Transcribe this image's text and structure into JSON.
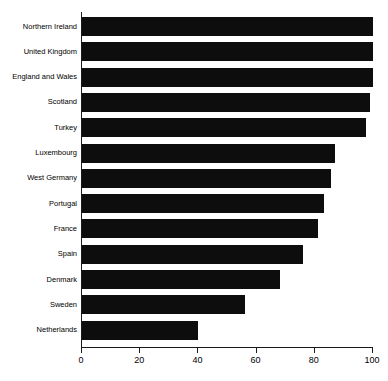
{
  "chart_data": {
    "type": "bar",
    "orientation": "horizontal",
    "title": "",
    "subtitle": "",
    "xlabel": "",
    "ylabel": "",
    "xlim": [
      0,
      100
    ],
    "xticks": [
      0,
      20,
      40,
      60,
      80,
      100
    ],
    "xtick_labels": [
      "0",
      "20",
      "40",
      "60",
      "80",
      "100"
    ],
    "grid": false,
    "legend": false,
    "bar_color": "#0d0d0d",
    "axis_color": "#1a1a1a",
    "categories": [
      "Northern Ireland",
      "United Kingdom",
      "England and Wales",
      "Scotland",
      "Turkey",
      "Luxembourg",
      "West Germany",
      "Portugal",
      "France",
      "Spain",
      "Denmark",
      "Sweden",
      "Netherlands"
    ],
    "values": [
      100,
      100,
      100,
      99,
      97.5,
      87,
      85.5,
      83,
      81,
      76,
      68,
      56,
      40
    ]
  }
}
